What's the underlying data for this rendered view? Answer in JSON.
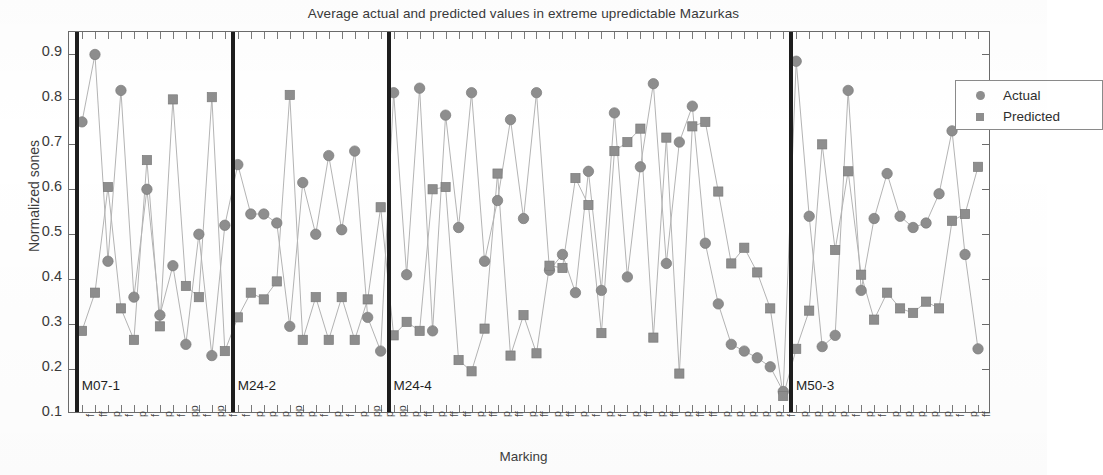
{
  "chart_data": {
    "type": "line",
    "title": "Average actual and predicted values in extreme upredictable Mazurkas",
    "xlabel": "Marking",
    "ylabel": "Normalized sones",
    "ylim": [
      0.1,
      0.95
    ],
    "yticks": [
      0.1,
      0.2,
      0.3,
      0.4,
      0.5,
      0.6,
      0.7,
      0.8,
      0.9
    ],
    "ytick_labels": [
      "0.1",
      "0.2",
      "0.3",
      "0.4",
      "0.5",
      "0.6",
      "0.7",
      "0.8",
      "0.9"
    ],
    "grid": false,
    "legend_position": "top-right",
    "legend": [
      "Actual",
      "Predicted"
    ],
    "series": [
      {
        "name": "Actual",
        "marker": "circle",
        "color": "#8e8e8e",
        "values": [
          0.75,
          0.9,
          0.44,
          0.82,
          0.36,
          0.6,
          0.32,
          0.43,
          0.255,
          0.5,
          0.23,
          0.52,
          0.655,
          0.545,
          0.545,
          0.525,
          0.295,
          0.615,
          0.5,
          0.675,
          0.51,
          0.685,
          0.315,
          0.24,
          0.815,
          0.41,
          0.825,
          0.285,
          0.765,
          0.515,
          0.815,
          0.44,
          0.575,
          0.755,
          0.535,
          0.815,
          0.42,
          0.455,
          0.37,
          0.64,
          0.375,
          0.77,
          0.405,
          0.65,
          0.835,
          0.435,
          0.705,
          0.785,
          0.48,
          0.345,
          0.255,
          0.24,
          0.225,
          0.205,
          0.15,
          0.885,
          0.54,
          0.25,
          0.275,
          0.82,
          0.375,
          0.535,
          0.635,
          0.54,
          0.515,
          0.525,
          0.59,
          0.73,
          0.455,
          0.245
        ],
        "connected": true
      },
      {
        "name": "Predicted",
        "marker": "square",
        "color": "#8e8e8e",
        "values": [
          0.285,
          0.37,
          0.605,
          0.335,
          0.265,
          0.665,
          0.295,
          0.8,
          0.385,
          0.36,
          0.805,
          0.24,
          0.315,
          0.37,
          0.355,
          0.395,
          0.81,
          0.265,
          0.36,
          0.265,
          0.36,
          0.265,
          0.355,
          0.56,
          0.275,
          0.305,
          0.285,
          0.6,
          0.605,
          0.22,
          0.195,
          0.29,
          0.635,
          0.23,
          0.32,
          0.235,
          0.43,
          0.425,
          0.625,
          0.565,
          0.28,
          0.685,
          0.705,
          0.735,
          0.27,
          0.715,
          0.19,
          0.74,
          0.75,
          0.595,
          0.435,
          0.47,
          0.415,
          0.335,
          0.14,
          0.245,
          0.33,
          0.7,
          0.465,
          0.64,
          0.41,
          0.31,
          0.37,
          0.335,
          0.325,
          0.35,
          0.335,
          0.53,
          0.545,
          0.65
        ],
        "connected": true
      }
    ],
    "sections": [
      {
        "label": "M07-1",
        "start_index": 0,
        "end_index": 11
      },
      {
        "label": "M24-2",
        "start_index": 12,
        "end_index": 23
      },
      {
        "label": "M24-4",
        "start_index": 24,
        "end_index": 54
      },
      {
        "label": "M50-3",
        "start_index": 55,
        "end_index": 69
      }
    ],
    "xtick_labels": [
      "f",
      "ff",
      "p",
      "f",
      "p",
      "f",
      "p",
      "f",
      "pp",
      "f",
      "pp",
      "f",
      "f",
      "p",
      "p",
      "p",
      "pp",
      "p",
      "f",
      "p",
      "f",
      "p",
      "pp",
      "p",
      "pp",
      "p",
      "ff",
      "p",
      "ff",
      "ff",
      "p",
      "ff",
      "p",
      "ff",
      "p",
      "ff",
      "p",
      "ff",
      "p",
      "f",
      "p",
      "f",
      "p",
      "ff",
      "p",
      "ff",
      "p",
      "ff",
      "ff",
      "p",
      "p",
      "p",
      "p",
      "p",
      "f",
      "p",
      "p",
      "p",
      "p",
      "f",
      "p",
      "f",
      "p",
      "p",
      "p",
      "p",
      "p",
      "f",
      "p",
      "ff"
    ]
  },
  "legend": {
    "actual_label": "Actual",
    "predicted_label": "Predicted"
  },
  "axes": {
    "title": "Average actual and predicted values in extreme upredictable Mazurkas",
    "ylabel": "Normalized sones",
    "xlabel": "Marking"
  }
}
